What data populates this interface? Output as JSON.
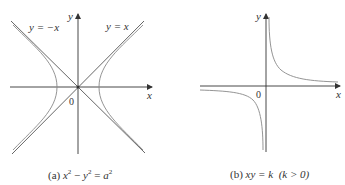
{
  "figure_a": {
    "caption_prefix": "(a)",
    "caption_equation": {
      "lhs_x": "x",
      "exp1": "2",
      "minus": " − ",
      "lhs_y": "y",
      "exp2": "2",
      "eq": " = ",
      "rhs": "a",
      "exp3": "2"
    },
    "x_label": "x",
    "y_label": "y",
    "origin_label": "0",
    "asymptote_left_label": "y = −x",
    "asymptote_right_label": "y = x",
    "curve_color": "#7a7a7a",
    "axis_color": "#333333"
  },
  "figure_b": {
    "caption_prefix": "(b)",
    "caption_equation": "xy = k",
    "caption_condition": "(k > 0)",
    "x_label": "x",
    "y_label": "y",
    "origin_label": "0",
    "curve_color": "#7a7a7a",
    "axis_color": "#333333"
  }
}
